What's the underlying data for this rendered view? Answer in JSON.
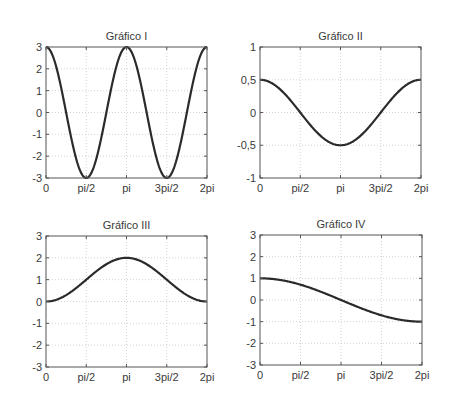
{
  "chart_data": [
    {
      "type": "line",
      "title": "Gráfico I",
      "xlabel": "",
      "ylabel": "",
      "xlim": [
        0,
        6.283185307
      ],
      "ylim": [
        -3,
        3
      ],
      "grid": true,
      "x_ticks": [
        0,
        1.5707963,
        3.1415927,
        4.712389,
        6.2831853
      ],
      "x_tick_labels": [
        "0",
        "pi/2",
        "pi",
        "3pi/2",
        "2pi"
      ],
      "y_ticks": [
        -3,
        -2,
        -1,
        0,
        1,
        2,
        3
      ],
      "y_tick_labels": [
        "-3",
        "-2",
        "-1",
        "0",
        "1",
        "2",
        "3"
      ],
      "function": "3*cos(2x)",
      "series": [
        {
          "name": "y",
          "x": [
            0,
            0.785,
            1.571,
            2.356,
            3.142,
            3.927,
            4.712,
            5.498,
            6.283
          ],
          "values": [
            3,
            0,
            -3,
            0,
            3,
            0,
            -3,
            0,
            3
          ]
        }
      ],
      "box": {
        "left": 46,
        "top": 47,
        "right": 207,
        "bottom": 178
      }
    },
    {
      "type": "line",
      "title": "Gráfico II",
      "xlabel": "",
      "ylabel": "",
      "xlim": [
        0,
        6.283185307
      ],
      "ylim": [
        -1,
        1
      ],
      "grid": true,
      "x_ticks": [
        0,
        1.5707963,
        3.1415927,
        4.712389,
        6.2831853
      ],
      "x_tick_labels": [
        "0",
        "pi/2",
        "pi",
        "3pi/2",
        "2pi"
      ],
      "y_ticks": [
        -1,
        -0.5,
        0,
        0.5,
        1
      ],
      "y_tick_labels": [
        "-1",
        "-0,5",
        "0",
        "0,5",
        "1"
      ],
      "function": "0.5*cos(x)",
      "series": [
        {
          "name": "y",
          "x": [
            0,
            1.571,
            3.142,
            4.712,
            6.283
          ],
          "values": [
            0.5,
            0,
            -0.5,
            0,
            0.5
          ]
        }
      ],
      "box": {
        "left": 260,
        "top": 47,
        "right": 421,
        "bottom": 178
      }
    },
    {
      "type": "line",
      "title": "Gráfico III",
      "xlabel": "",
      "ylabel": "",
      "xlim": [
        0,
        6.283185307
      ],
      "ylim": [
        -3,
        3
      ],
      "grid": true,
      "x_ticks": [
        0,
        1.5707963,
        3.1415927,
        4.712389,
        6.2831853
      ],
      "x_tick_labels": [
        "0",
        "pi/2",
        "pi",
        "3pi/2",
        "2pi"
      ],
      "y_ticks": [
        -3,
        -2,
        -1,
        0,
        1,
        2,
        3
      ],
      "y_tick_labels": [
        "-3",
        "-2",
        "-1",
        "0",
        "1",
        "2",
        "3"
      ],
      "function": "1-cos(x)",
      "series": [
        {
          "name": "y",
          "x": [
            0,
            1.571,
            3.142,
            4.712,
            6.283
          ],
          "values": [
            0,
            1,
            2,
            1,
            0
          ]
        }
      ],
      "box": {
        "left": 46,
        "top": 236,
        "right": 207,
        "bottom": 367
      }
    },
    {
      "type": "line",
      "title": "Gráfico IV",
      "xlabel": "",
      "ylabel": "",
      "xlim": [
        0,
        6.283185307
      ],
      "ylim": [
        -3,
        3
      ],
      "grid": true,
      "x_ticks": [
        0,
        1.5707963,
        3.1415927,
        4.712389,
        6.2831853
      ],
      "x_tick_labels": [
        "0",
        "pi/2",
        "pi",
        "3pi/2",
        "2pi"
      ],
      "y_ticks": [
        -3,
        -2,
        -1,
        0,
        1,
        2,
        3
      ],
      "y_tick_labels": [
        "-3",
        "-2",
        "-1",
        "0",
        "1",
        "2",
        "3"
      ],
      "function": "cos(x/2)",
      "series": [
        {
          "name": "y",
          "x": [
            0,
            1.571,
            3.142,
            4.712,
            6.283
          ],
          "values": [
            1,
            0.707,
            0,
            -0.707,
            -1
          ]
        }
      ],
      "box": {
        "left": 260,
        "top": 235,
        "right": 422,
        "bottom": 365
      }
    }
  ],
  "colors": {
    "curve": "#2b2b2b",
    "axes": "#555555",
    "grid": "#c8c8c8",
    "text": "#3a3a3a",
    "background": "#ffffff"
  }
}
